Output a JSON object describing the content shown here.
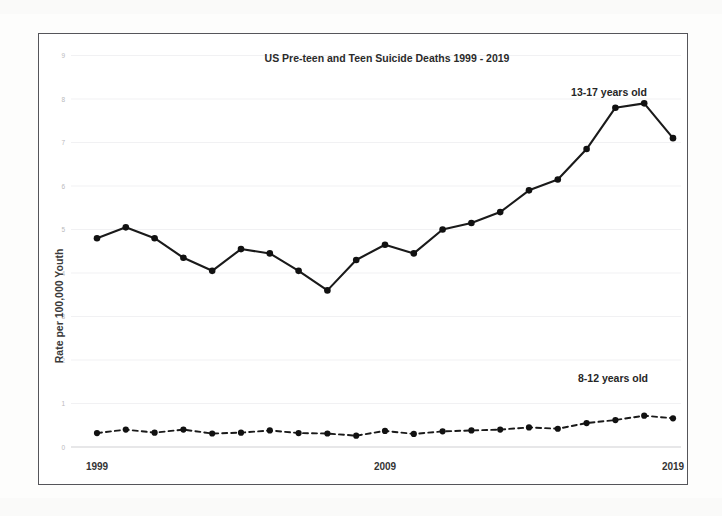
{
  "figure": {
    "title": "US Pre-teen and Teen Suicide Deaths 1999 - 2019",
    "y_axis_title": "Rate per 100,000 Youth",
    "x_tick_labels": [
      "1999",
      "2009",
      "2019"
    ],
    "y_tick_labels": [
      "0",
      "1",
      "2",
      "3",
      "4",
      "5",
      "6",
      "7",
      "8",
      "9"
    ],
    "series_label_upper": "13-17 years old",
    "series_label_lower": "8-12 years old",
    "frame_color": "#55555a",
    "line_color": "#1a1a1a",
    "grid_color": "#ededf0"
  },
  "chart_data": {
    "type": "line",
    "title": "US Pre-teen and Teen Suicide Deaths 1999 - 2019",
    "xlabel": "",
    "ylabel": "Rate per 100,000 Youth",
    "xlim": [
      1999,
      2019
    ],
    "ylim": [
      0,
      9
    ],
    "yticks": [
      0,
      1,
      2,
      3,
      4,
      5,
      6,
      7,
      8,
      9
    ],
    "xticks": [
      1999,
      2009,
      2019
    ],
    "grid": true,
    "legend": "inline-annotations",
    "x": [
      1999,
      2000,
      2001,
      2002,
      2003,
      2004,
      2005,
      2006,
      2007,
      2008,
      2009,
      2010,
      2011,
      2012,
      2013,
      2014,
      2015,
      2016,
      2017,
      2018,
      2019
    ],
    "series": [
      {
        "name": "13-17 years old",
        "style": "solid",
        "marker": "circle",
        "annotation": "13-17 years old",
        "values": [
          4.8,
          5.05,
          4.8,
          4.35,
          4.05,
          4.55,
          4.45,
          4.05,
          3.6,
          4.3,
          4.65,
          4.45,
          5.0,
          5.15,
          5.4,
          5.9,
          6.15,
          6.85,
          7.8,
          7.9,
          7.1
        ]
      },
      {
        "name": "8-12 years old",
        "style": "dashed",
        "marker": "circle",
        "annotation": "8-12 years old",
        "values": [
          0.32,
          0.4,
          0.33,
          0.4,
          0.31,
          0.33,
          0.38,
          0.32,
          0.31,
          0.26,
          0.37,
          0.3,
          0.36,
          0.38,
          0.4,
          0.45,
          0.42,
          0.55,
          0.62,
          0.72,
          0.66
        ]
      }
    ]
  }
}
